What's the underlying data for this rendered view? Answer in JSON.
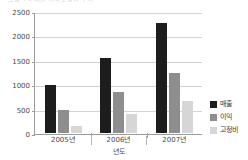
{
  "top_sliver_text": "그림 4-3  매출·이익·고정비 추이",
  "chart_data": {
    "type": "bar",
    "title": "",
    "xlabel": "년도",
    "ylabel": "",
    "categories": [
      "2005년",
      "2006년",
      "2007년"
    ],
    "series": [
      {
        "name": "매출",
        "color": "#1d1d1d",
        "values": [
          1000,
          1540,
          2270
        ]
      },
      {
        "name": "이익",
        "color": "#8e8e8e",
        "values": [
          480,
          840,
          1230
        ]
      },
      {
        "name": "고정비",
        "color": "#d6d6d6",
        "values": [
          140,
          390,
          670
        ]
      }
    ],
    "ylim": [
      0,
      2500
    ],
    "yticks": [
      0,
      500,
      1000,
      1500,
      2000,
      2500
    ],
    "ytick_labels": [
      "0",
      "500",
      "1000",
      "1500",
      "2000",
      "2500"
    ],
    "grid": true,
    "legend_position": "right"
  }
}
